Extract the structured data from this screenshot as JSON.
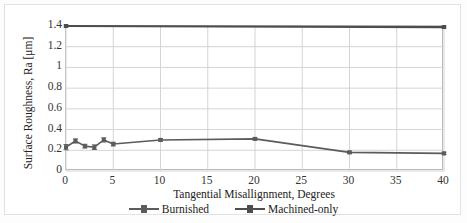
{
  "chart_data": {
    "type": "line",
    "title": "",
    "subtitle": "",
    "xlabel": "Tangential Misallignment, Degrees",
    "ylabel": "Surface Roughness, Ra [μm]",
    "xlim": [
      0,
      40
    ],
    "ylim": [
      0,
      1.4
    ],
    "xticks": [
      "0",
      "5",
      "10",
      "15",
      "20",
      "25",
      "30",
      "35",
      "40"
    ],
    "xtick_values": [
      0,
      5,
      10,
      15,
      20,
      25,
      30,
      35,
      40
    ],
    "yticks": [
      "0",
      "0.2",
      "0.4",
      "0.6",
      "0.8",
      "1",
      "1.2",
      "1.4"
    ],
    "ytick_values": [
      0,
      0.2,
      0.4,
      0.6,
      0.8,
      1.0,
      1.2,
      1.4
    ],
    "grid": "horizontal-and-vertical",
    "legend_position": "bottom-center",
    "error_bars": true,
    "series": [
      {
        "name": "Burnished",
        "color": "#5b5b5b",
        "marker": "square",
        "x": [
          0,
          1,
          2,
          3,
          4,
          5,
          10,
          20,
          30,
          40
        ],
        "values": [
          0.23,
          0.29,
          0.24,
          0.23,
          0.3,
          0.26,
          0.3,
          0.31,
          0.18,
          0.17
        ],
        "yerr": [
          0.025,
          0.02,
          0.018,
          0.022,
          0.02,
          0.018,
          0.012,
          0.012,
          0.012,
          0.012
        ]
      },
      {
        "name": "Machined-only",
        "color": "#4d4d4d",
        "marker": "square",
        "x": [
          0,
          40
        ],
        "values": [
          1.4,
          1.39
        ],
        "yerr": [
          0.01,
          0.01
        ]
      }
    ]
  },
  "axes": {
    "y_title": "Surface Roughness, Ra [μm]",
    "x_title": "Tangential Misallignment, Degrees",
    "y_labels": [
      "1.4",
      "1.2",
      "1",
      "0.8",
      "0.6",
      "0.4",
      "0.2",
      "0"
    ],
    "x_labels": [
      "0",
      "5",
      "10",
      "15",
      "20",
      "25",
      "30",
      "35",
      "40"
    ]
  },
  "legend": {
    "items": [
      {
        "label": "Burnished",
        "color": "#5b5b5b"
      },
      {
        "label": "Machined-only",
        "color": "#4d4d4d"
      }
    ]
  },
  "colors": {
    "burnished": "#5b5b5b",
    "machined_only": "#4d4d4d",
    "grid": "#d4d4d4",
    "axis": "#b9b9b9",
    "text": "#2b2b2b"
  }
}
